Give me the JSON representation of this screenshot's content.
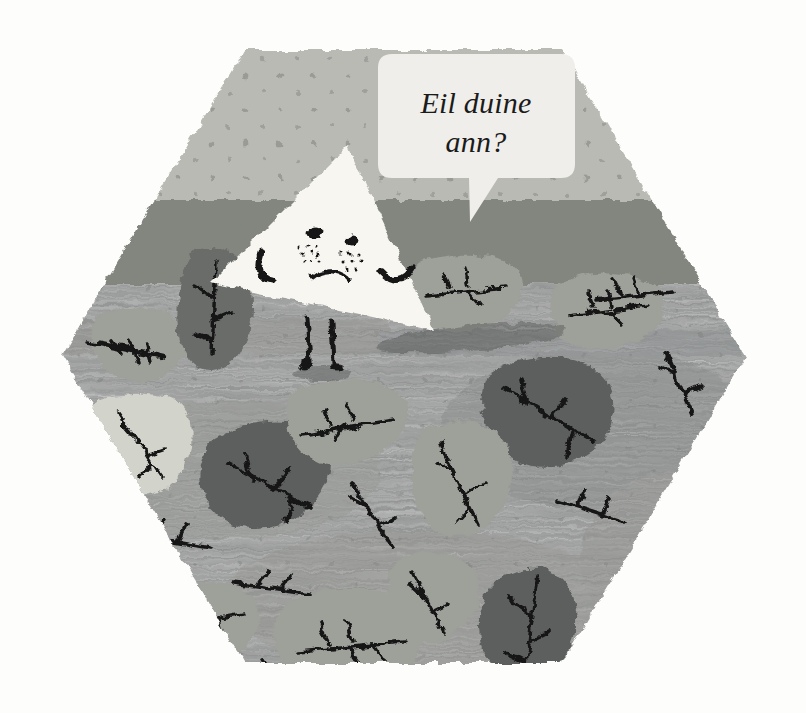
{
  "illustration": {
    "title": "Hexagonal autumn scene with triangle character",
    "canvas": {
      "width": 806,
      "height": 713,
      "background": "#fdfdfc"
    },
    "speech_bubble": {
      "name": "speech-bubble",
      "line1": "Eil duine",
      "line2": "ann?",
      "full_text": "Eil duine ann?",
      "language": "Scottish Gaelic",
      "translation_note": "",
      "fill": "#efeeea",
      "text_color": "#1b1b1b",
      "style": "italic serif"
    },
    "character": {
      "name": "triangle-character",
      "shape": "triangle",
      "fill": "#f7f6f1",
      "expression": "sad",
      "features": [
        "two-eyes",
        "freckles",
        "frown-mouth",
        "two-arms",
        "two-legs",
        "shadow"
      ],
      "eye_color": "#151515",
      "line_color": "#181818"
    },
    "hexagon": {
      "name": "hexagon-frame",
      "vertices": "6",
      "sky_color": "#b9bab4",
      "midband_color": "#8b8d87",
      "ground_color": "#87898a",
      "ground_color_dark": "#7e807f",
      "edge_texture": "grainy"
    },
    "palette": {
      "sky": "#b9bab4",
      "sky_dots": "#95978f",
      "mid_band": "#8c8e88",
      "ground": "#8b8d8c",
      "ground_light": "#9a9c99",
      "leaf_light": "#d2d3cb",
      "leaf_mid": "#9ea09a",
      "leaf_pale": "#a9aba4",
      "leaf_dark": "#6a6c6b",
      "leaf_darkest": "#5d5f5e",
      "vein": "#141414",
      "bubble": "#efeeea",
      "triangle": "#f7f6f1",
      "ink": "#161616"
    },
    "leaves": [
      {
        "id": "leaf-1",
        "tone": "dark",
        "note": "left of character, tall pointed"
      },
      {
        "id": "leaf-2",
        "tone": "pale",
        "note": "far left edge"
      },
      {
        "id": "leaf-3",
        "tone": "light",
        "note": "left mid, lightest leaf"
      },
      {
        "id": "leaf-4",
        "tone": "darkest",
        "note": "left center, large oval"
      },
      {
        "id": "leaf-5",
        "tone": "mid",
        "note": "center, below character"
      },
      {
        "id": "leaf-6",
        "tone": "mid",
        "note": "right of character head"
      },
      {
        "id": "leaf-7",
        "tone": "mid",
        "note": "upper right"
      },
      {
        "id": "leaf-8",
        "tone": "darkest",
        "note": "right center, big teardrop"
      },
      {
        "id": "leaf-9",
        "tone": "mid",
        "note": "center right, elongated"
      },
      {
        "id": "leaf-10",
        "tone": "mid",
        "note": "lower center"
      },
      {
        "id": "leaf-11",
        "tone": "darkest",
        "note": "bottom right, pointed"
      },
      {
        "id": "leaf-12",
        "tone": "mid",
        "note": "bottom center large"
      },
      {
        "id": "leaf-13",
        "tone": "mid",
        "note": "bottom left"
      }
    ],
    "twigs": {
      "count": 14,
      "color": "#141414",
      "description": "scattered bare twig marks across ground"
    }
  }
}
